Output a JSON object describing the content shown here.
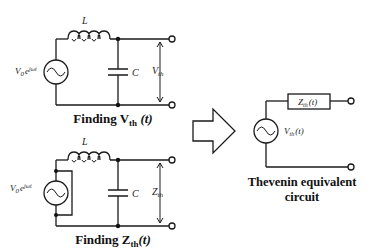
{
  "diagram": {
    "top_circuit": {
      "title": "Finding V",
      "title_sub": "th",
      "title_tail": " (t)",
      "source_label": "V",
      "source_sub": "0",
      "source_sup": "e",
      "source_exp": "jωt",
      "inductor_label": "L",
      "capacitor_label": "C",
      "output_label": "V",
      "output_sub": "th"
    },
    "bottom_circuit": {
      "title": "Finding Z",
      "title_sub": "th",
      "title_tail": "(t)",
      "source_label": "V",
      "source_sub": "0",
      "source_sup": "e",
      "source_exp": "jωt",
      "inductor_label": "L",
      "capacitor_label": "C",
      "output_label": "Z",
      "output_sub": "th",
      "note": "source shorted"
    },
    "arrow": "right-arrow",
    "equivalent_circuit": {
      "title_line1": "Thevenin equivalent",
      "title_line2": "circuit",
      "impedance_label": "Z",
      "impedance_sub": "th",
      "impedance_tail": "(t)",
      "source_label": "V",
      "source_sub": "th",
      "source_tail": "(t)"
    }
  }
}
